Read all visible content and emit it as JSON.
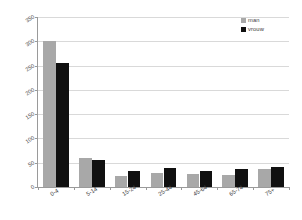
{
  "chart_data": {
    "type": "bar",
    "title": "",
    "subtitle": "",
    "xlabel": "",
    "ylabel": "",
    "categories": [
      "0-4",
      "5-14",
      "15-24",
      "25-44",
      "45-64",
      "65-74",
      "75+"
    ],
    "series": [
      {
        "name": "man",
        "color": "#a8a8a8",
        "values": [
          300,
          60,
          22,
          28,
          26,
          24,
          38
        ]
      },
      {
        "name": "vrouw",
        "color": "#101010",
        "values": [
          255,
          55,
          33,
          40,
          33,
          38,
          41
        ]
      }
    ],
    "ylim": [
      0,
      350
    ],
    "ytick_values": [
      350,
      300,
      250,
      200,
      150,
      100,
      50,
      0
    ],
    "ytick_labels": [
      "350",
      "300",
      "250",
      "200",
      "150",
      "100",
      "50",
      "0"
    ],
    "grid": true,
    "grid_axis": "y",
    "legend_position": "top-right",
    "legend": [
      {
        "label": "man",
        "color": "#a8a8a8"
      },
      {
        "label": "vrouw",
        "color": "#101010"
      }
    ],
    "xtick_rotation": -32,
    "ytick_rotation": -32,
    "background_color": "#ffffff",
    "axis_color": "#9a9a9a",
    "gridline_color": "#d9d9d9"
  }
}
